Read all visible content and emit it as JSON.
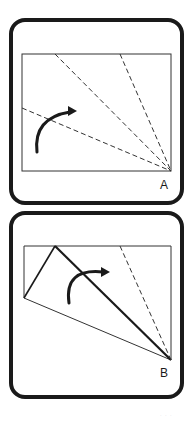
{
  "figure": {
    "stroke_color": "#1a1a1a",
    "background": "#ffffff",
    "panels": [
      {
        "id": "A",
        "label": "A",
        "frame": {
          "x": 11,
          "y": 20,
          "w": 171,
          "h": 183,
          "radius": 14,
          "stroke_width": 4
        },
        "sheet": {
          "x": 22,
          "y": 54,
          "w": 149,
          "h": 117
        },
        "fold_lines_dashed": [
          {
            "x1": 55,
            "y1": 54,
            "x2": 171,
            "y2": 171
          },
          {
            "x1": 120,
            "y1": 54,
            "x2": 171,
            "y2": 171
          },
          {
            "x1": 22,
            "y1": 108,
            "x2": 171,
            "y2": 171
          }
        ],
        "arrow": {
          "from": [
            37,
            152
          ],
          "to": [
            76,
            111
          ],
          "direction": "clockwise"
        },
        "label_pos": {
          "x": 160,
          "y": 178
        }
      },
      {
        "id": "B",
        "label": "B",
        "frame": {
          "x": 11,
          "y": 213,
          "w": 171,
          "h": 184,
          "radius": 14,
          "stroke_width": 4
        },
        "sheet_outline": [
          [
            24,
            246
          ],
          [
            171,
            246
          ],
          [
            171,
            360
          ],
          [
            24,
            298
          ]
        ],
        "folded_flap": [
          [
            24,
            298
          ],
          [
            55,
            246
          ],
          [
            171,
            360
          ]
        ],
        "fold_crease_bold": {
          "x1": 55,
          "y1": 246,
          "x2": 171,
          "y2": 360
        },
        "fold_lines_dashed": [
          {
            "x1": 120,
            "y1": 246,
            "x2": 171,
            "y2": 360
          }
        ],
        "arrow": {
          "from": [
            69,
            303
          ],
          "to": [
            109,
            272
          ],
          "direction": "clockwise"
        },
        "label_pos": {
          "x": 160,
          "y": 366
        }
      }
    ],
    "footer_artifact": "· · ·"
  }
}
